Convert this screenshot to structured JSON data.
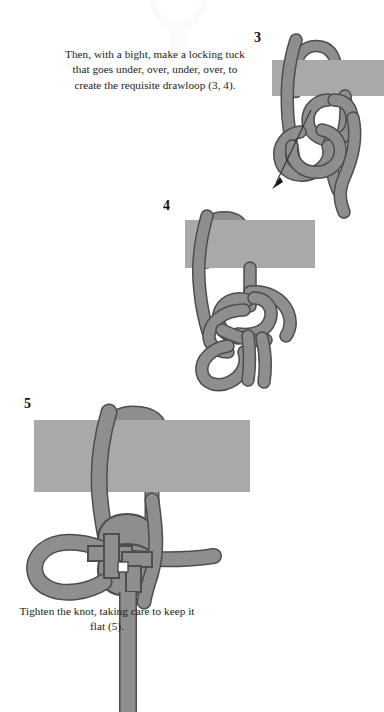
{
  "document": {
    "title": "Knot Tying Instructions — Steps 3, 4, 5",
    "type": "illustrated-instruction-diagram",
    "page_background": "#ffffff"
  },
  "colors": {
    "rope_fill": "#8e8e8e",
    "rope_outline": "#4d4d4d",
    "bar_fill": "#a9a9a9",
    "bar_outline": "#a9a9a9",
    "text": "#111111",
    "arrow": "#333333",
    "ghost_figure": "#fbfbfb"
  },
  "captions": {
    "top": "Then, with a bight, make a locking tuck that goes under, over, under, over, to create the requisite drawloop (3, 4).",
    "bottom": "Tighten the knot, taking care to keep it flat (5)."
  },
  "steps": [
    {
      "number": "3",
      "label": "step-3",
      "bar": {
        "x": 272,
        "y": 60,
        "width": 112,
        "height": 36
      },
      "has_arrow": true,
      "arrow": {
        "from_x": 311,
        "from_y": 112,
        "to_x": 272,
        "to_y": 188
      }
    },
    {
      "number": "4",
      "label": "step-4",
      "bar": {
        "x": 185,
        "y": 220,
        "width": 130,
        "height": 48
      },
      "has_arrow": false
    },
    {
      "number": "5",
      "label": "step-5",
      "bar": {
        "x": 34,
        "y": 420,
        "width": 216,
        "height": 72
      },
      "has_arrow": false
    }
  ],
  "ghost_top_figure": {
    "present": true,
    "description": "faint cropped remnant of the previous figure at the top edge"
  }
}
